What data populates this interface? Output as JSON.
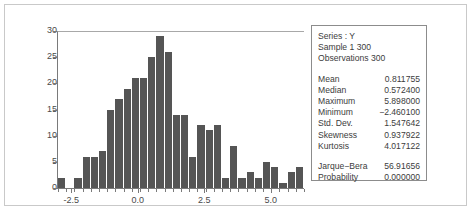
{
  "chart_data": {
    "type": "bar",
    "title": "",
    "xlabel": "",
    "ylabel": "",
    "ylim": [
      0,
      30
    ],
    "xlim": [
      -3.0,
      6.25
    ],
    "grid": false,
    "legend": null,
    "ytick_labels": [
      "0",
      "5",
      "10",
      "15",
      "20",
      "25",
      "30"
    ],
    "ytick_values": [
      0,
      5,
      10,
      15,
      20,
      25,
      30
    ],
    "xtick_labels": [
      "-2.5",
      "0.0",
      "2.5",
      "5.0"
    ],
    "xtick_values": [
      -2.5,
      0.0,
      2.5,
      5.0
    ],
    "bin_width": 0.3125,
    "bin_starts": [
      -2.8125,
      -2.5,
      -2.1875,
      -1.875,
      -1.5625,
      -1.25,
      -0.9375,
      -0.625,
      -0.3125,
      0.0,
      0.3125,
      0.625,
      0.9375,
      1.25,
      1.5625,
      1.875,
      2.1875,
      2.5,
      2.8125,
      3.125,
      3.4375,
      3.75,
      4.0625,
      4.375,
      4.6875,
      5.0,
      5.3125,
      5.625
    ],
    "values": [
      2,
      0,
      2,
      6,
      6,
      7,
      15,
      17,
      19,
      21,
      21,
      25,
      29,
      26,
      14,
      14,
      6,
      12,
      11,
      12,
      2,
      8,
      2,
      3,
      2,
      5,
      4,
      1,
      3,
      4
    ],
    "bar_color": "#555555"
  },
  "stats": {
    "header": [
      "Series : Y",
      "Sample  1 300",
      "Observations  300"
    ],
    "rows": [
      {
        "key": "Mean",
        "value": "0.811755"
      },
      {
        "key": "Median",
        "value": "0.572400"
      },
      {
        "key": "Maximum",
        "value": "5.898000"
      },
      {
        "key": "Minimum",
        "value": "−2.460100"
      },
      {
        "key": "Std. Dev.",
        "value": "1.547642"
      },
      {
        "key": "Skewness",
        "value": "0.937922"
      },
      {
        "key": "Kurtosis",
        "value": "4.017122"
      }
    ],
    "tests": [
      {
        "key": "Jarque−Bera",
        "value": "56.91656"
      },
      {
        "key": "Probability",
        "value": "0.000000"
      }
    ]
  },
  "colors": {
    "bar": "#555555",
    "axis": "#7a7a7a",
    "frame": "#c9c9c9",
    "stats_border": "#8c8c8c",
    "text": "#3c3c3c",
    "background": "#ffffff"
  }
}
